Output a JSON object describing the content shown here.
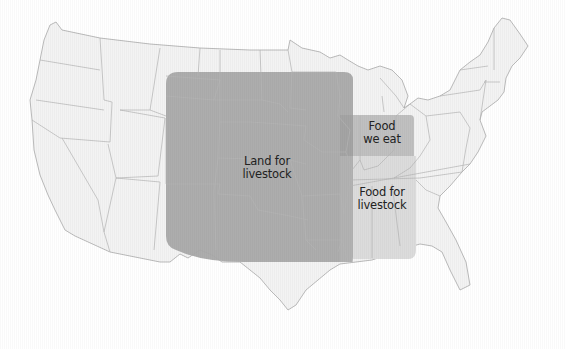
{
  "map": {
    "title": "Land use for food in the contiguous United States",
    "colors": {
      "background": "#ffffff",
      "land_fill": "#f3f3f3",
      "state_border": "#b9b9b9",
      "land_for_livestock": "#a9a9a9",
      "food_we_eat": "#c0c0c0",
      "food_for_livestock": "#dcdcdc",
      "label_text": "#222222"
    },
    "regions": [
      {
        "id": "land-for-livestock",
        "label_line1": "Land for",
        "label_line2": "livestock"
      },
      {
        "id": "food-we-eat",
        "label_line1": "Food",
        "label_line2": "we eat"
      },
      {
        "id": "food-for-livestock",
        "label_line1": "Food for",
        "label_line2": "livestock"
      }
    ]
  }
}
